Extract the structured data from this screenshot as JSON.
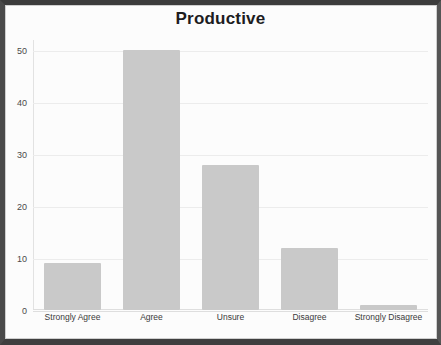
{
  "chart_data": {
    "type": "bar",
    "title": "Productive",
    "xlabel": "",
    "ylabel": "",
    "categories": [
      "Strongly Agree",
      "Agree",
      "Unsure",
      "Disagree",
      "Strongly Disagree"
    ],
    "values": [
      9,
      50,
      28,
      12,
      1
    ],
    "ylim": [
      0,
      52
    ],
    "yticks": [
      0,
      10,
      20,
      30,
      40,
      50
    ],
    "ytick_labels": [
      "0",
      "10",
      "20",
      "30",
      "40",
      "50"
    ],
    "grid": true,
    "legend": false,
    "bar_color": "#c9c9c9",
    "background_color": "#fcfcfc",
    "title_color": "#1d1d1f",
    "gridline_color": "#ececec",
    "tick_label_color": "#4a4a4a"
  }
}
